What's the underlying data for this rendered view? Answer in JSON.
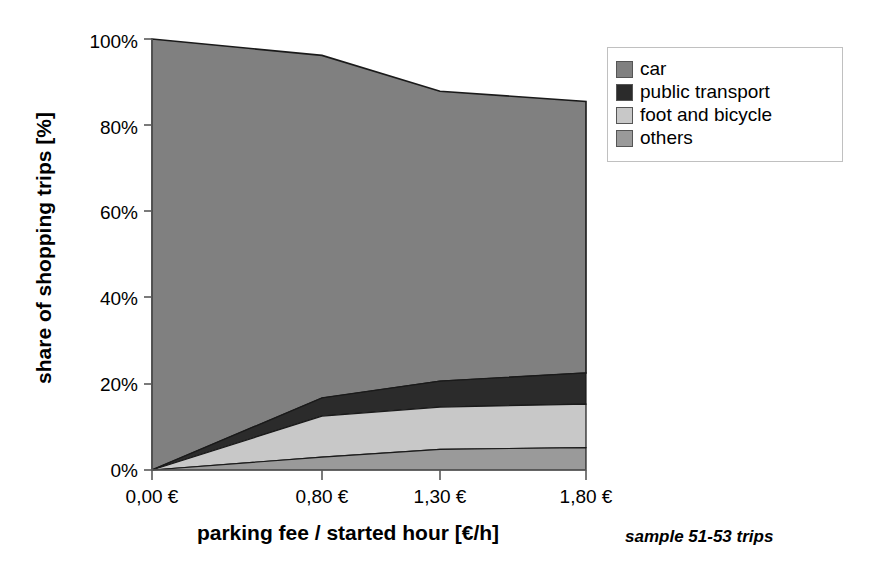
{
  "chart_data": {
    "type": "area",
    "title": "",
    "subtitle": "",
    "xlabel": "parking fee / started hour [€/h]",
    "ylabel": "share of shopping trips [%]",
    "categories": [
      "0,00 €",
      "0,80 €",
      "1,30 €",
      "1,80 €"
    ],
    "x_values": [
      0.0,
      0.8,
      1.3,
      1.8
    ],
    "xlim": [
      0,
      1.8
    ],
    "ylim": [
      0,
      100
    ],
    "y_ticks": [
      "0%",
      "20%",
      "40%",
      "60%",
      "80%",
      "100%"
    ],
    "y_tick_values": [
      0,
      20,
      40,
      60,
      80,
      100
    ],
    "grid": false,
    "stacked": true,
    "stack_order": "others-bottom",
    "legend_position": "top-right",
    "annotation": "sample 51-53 trips",
    "series": [
      {
        "name": "others",
        "color": "#9a9a9a",
        "values": [
          0,
          3.0,
          4.8,
          5.2
        ]
      },
      {
        "name": "foot and bicycle",
        "color": "#c8c8c8",
        "values": [
          0,
          9.5,
          9.8,
          10.1
        ]
      },
      {
        "name": "public transport",
        "color": "#2b2b2b",
        "values": [
          0,
          4.2,
          6.0,
          7.2
        ]
      },
      {
        "name": "car",
        "color": "#808080",
        "values": [
          100,
          79.5,
          67.3,
          63.0
        ]
      }
    ],
    "cumulative_tops": {
      "others": [
        0,
        3.0,
        4.8,
        5.2
      ],
      "foot_and_bicycle": [
        0,
        12.5,
        14.6,
        15.3
      ],
      "public_transport": [
        0,
        16.7,
        20.6,
        22.5
      ],
      "car": [
        100,
        96.2,
        87.9,
        85.5
      ]
    }
  },
  "axes": {
    "y_title": "share of shopping trips [%]",
    "x_title": "parking fee / started hour [€/h]",
    "y_ticks": [
      {
        "label": "100%",
        "value": 100
      },
      {
        "label": "80%",
        "value": 80
      },
      {
        "label": "60%",
        "value": 60
      },
      {
        "label": "40%",
        "value": 40
      },
      {
        "label": "20%",
        "value": 20
      },
      {
        "label": "0%",
        "value": 0
      }
    ],
    "x_ticks": [
      {
        "label": "0,00 €",
        "value": 0
      },
      {
        "label": "0,80 €",
        "value": 0.8
      },
      {
        "label": "1,30 €",
        "value": 1.3
      },
      {
        "label": "1,80 €",
        "value": 1.8
      }
    ]
  },
  "legend": {
    "items": [
      {
        "label": "car",
        "color": "#808080"
      },
      {
        "label": "public transport",
        "color": "#2b2b2b"
      },
      {
        "label": "foot and bicycle",
        "color": "#c8c8c8"
      },
      {
        "label": "others",
        "color": "#9a9a9a"
      }
    ]
  },
  "note": {
    "text": "sample 51-53 trips"
  },
  "colors": {
    "car": "#808080",
    "public_transport": "#2b2b2b",
    "foot_and_bicycle": "#c8c8c8",
    "others": "#9a9a9a",
    "axis": "#595959",
    "outline": "#1a1a1a",
    "background": "#ffffff"
  }
}
